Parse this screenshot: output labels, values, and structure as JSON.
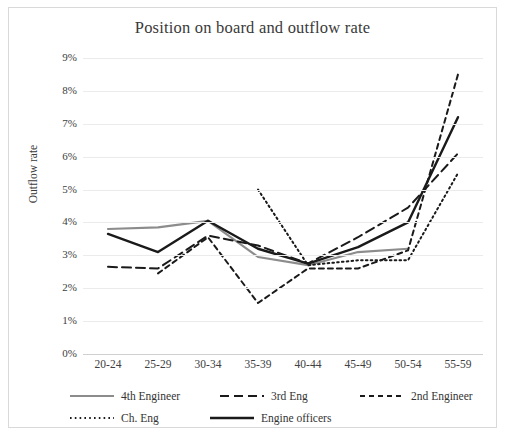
{
  "chart_data": {
    "type": "line",
    "title": "Position on board and outflow rate",
    "xlabel": "",
    "ylabel": "Outflow rate",
    "categories": [
      "20-24",
      "25-29",
      "30-34",
      "35-39",
      "40-44",
      "45-49",
      "50-54",
      "55-59"
    ],
    "ylim": [
      0,
      9
    ],
    "yticks": [
      "0%",
      "1%",
      "2%",
      "3%",
      "4%",
      "5%",
      "6%",
      "7%",
      "8%",
      "9%"
    ],
    "ytick_values": [
      0,
      1,
      2,
      3,
      4,
      5,
      6,
      7,
      8,
      9
    ],
    "grid": true,
    "legend_position": "bottom",
    "value_unit": "%",
    "series": [
      {
        "name": "4th Engineer",
        "style": "solid",
        "color": "#8c8c8c",
        "width": 2.2,
        "values": [
          3.8,
          3.85,
          4.05,
          2.95,
          2.7,
          3.1,
          3.2,
          null
        ]
      },
      {
        "name": "3rd Eng",
        "style": "longdash",
        "color": "#1a1a1a",
        "width": 2.0,
        "values": [
          2.65,
          2.6,
          3.6,
          3.3,
          2.75,
          3.55,
          4.45,
          6.1
        ]
      },
      {
        "name": "2nd Engineer",
        "style": "shortdash",
        "color": "#1a1a1a",
        "width": 2.0,
        "values": [
          null,
          2.45,
          3.55,
          1.55,
          2.6,
          2.6,
          3.15,
          8.5
        ]
      },
      {
        "name": "Ch. Eng",
        "style": "dotted",
        "color": "#1a1a1a",
        "width": 2.0,
        "values": [
          null,
          null,
          null,
          5.0,
          2.7,
          2.85,
          2.85,
          5.5
        ]
      },
      {
        "name": "Engine officers",
        "style": "solid",
        "color": "#1a1a1a",
        "width": 2.4,
        "values": [
          3.65,
          3.1,
          4.05,
          3.2,
          2.75,
          3.25,
          4.0,
          7.2
        ]
      }
    ]
  }
}
